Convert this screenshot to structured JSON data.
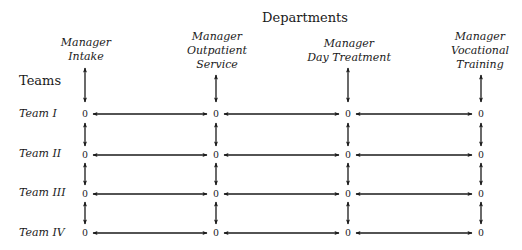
{
  "title": "Departments",
  "teams_header": "Teams",
  "departments": [
    {
      "line1": "Manager",
      "line2": "Intake",
      "line3": ""
    },
    {
      "line1": "Manager",
      "line2": "Outpatient",
      "line3": "Service"
    },
    {
      "line1": "Manager",
      "line2": "Day Treatment",
      "line3": ""
    },
    {
      "line1": "Manager",
      "line2": "Vocational",
      "line3": "Training"
    }
  ],
  "teams": [
    {
      "label": "Team I"
    },
    {
      "label": "Team II"
    },
    {
      "label": "Team III"
    },
    {
      "label": "Team IV"
    }
  ],
  "node_value": "0",
  "matrix": [
    [
      "0",
      "0",
      "0",
      "0"
    ],
    [
      "0",
      "0",
      "0",
      "0"
    ],
    [
      "0",
      "0",
      "0",
      "0"
    ],
    [
      "0",
      "0",
      "0",
      "0"
    ]
  ],
  "colors": {
    "ink": "#1a1a1a",
    "background": "#ffffff"
  }
}
